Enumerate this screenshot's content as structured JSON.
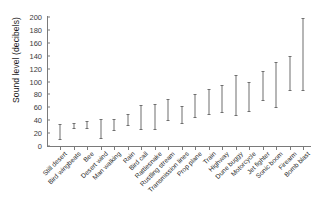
{
  "chart_data": {
    "type": "bar",
    "subtype": "range-error-bars",
    "title": "",
    "xlabel": "",
    "ylabel": "Sound level (decibels)",
    "ylim": [
      0,
      200
    ],
    "yticks": [
      0,
      20,
      40,
      60,
      80,
      100,
      120,
      140,
      160,
      180,
      200
    ],
    "grid": false,
    "legend": false,
    "categories": [
      "Still desert",
      "Bird wingbeats",
      "Bee",
      "Desert wind",
      "Man walking",
      "Rain",
      "Bird call",
      "Rattlesnake",
      "Rustling stream",
      "Transmission lines",
      "Prop plane",
      "Train",
      "Highway",
      "Dune buggy",
      "Motorcycle",
      "Jet fighter",
      "Sonic boom",
      "Firearm",
      "Bomb blast"
    ],
    "series": [
      {
        "name": "Sound level range (dB)",
        "low": [
          11,
          28,
          28,
          13,
          25,
          32,
          27,
          27,
          40,
          35,
          45,
          50,
          53,
          48,
          55,
          72,
          60,
          87,
          87
        ],
        "high": [
          34,
          35,
          38,
          42,
          42,
          50,
          63,
          65,
          73,
          62,
          80,
          88,
          95,
          110,
          100,
          117,
          131,
          140,
          198
        ]
      }
    ]
  }
}
